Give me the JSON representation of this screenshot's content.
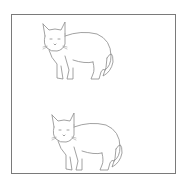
{
  "figure": {
    "frame_border_color": "#7a7a7a",
    "line_color": "#8a8a8a",
    "background_color": "#ffffff",
    "cats": [
      {
        "position": "top"
      },
      {
        "position": "bottom"
      }
    ]
  }
}
